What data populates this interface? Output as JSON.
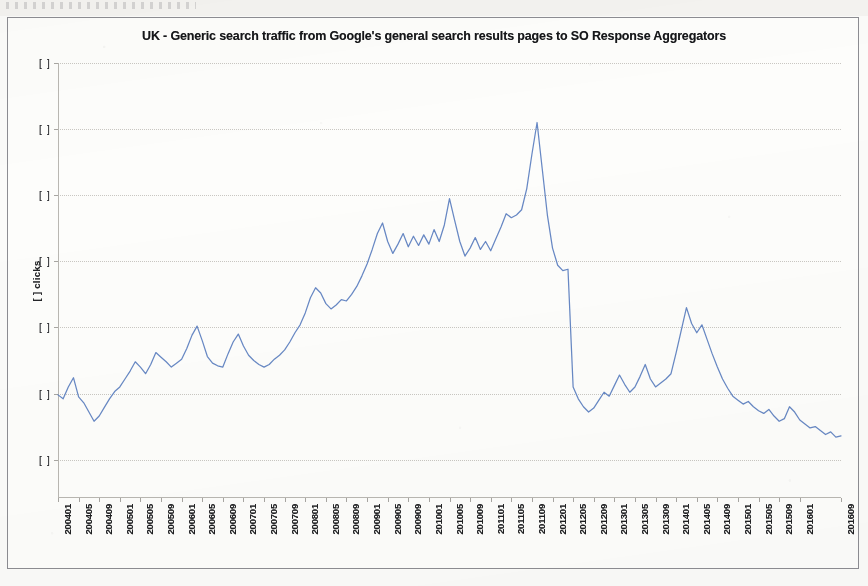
{
  "document": {
    "kind": "scanned-chart-page",
    "page_top_strip": ""
  },
  "chart": {
    "title": "UK - Generic search traffic from Google's general search results pages to SO Response Aggregators",
    "y_axis_title": "[ ] clicks",
    "line_color": "#5b7fc0",
    "gridline_color": "#c9c7c2",
    "frame_color": "#8d8d92",
    "background_color": "#fdfdfb",
    "redaction_marker": "[ ]",
    "y_tick_labels": [
      "[ ]",
      "[ ]",
      "[ ]",
      "[ ]",
      "[ ]",
      "[ ]",
      "[ ]"
    ]
  },
  "chart_data": {
    "type": "line",
    "title": "UK - Generic search traffic from Google's general search results pages to SO Response Aggregators",
    "xlabel": "",
    "ylabel": "[ ] clicks",
    "grid": true,
    "legend": false,
    "y_axis_redacted": true,
    "y_tick_labels": [
      "[ ]",
      "[ ]",
      "[ ]",
      "[ ]",
      "[ ]",
      "[ ]",
      "[ ]"
    ],
    "y_tick_values": [
      7,
      6,
      5,
      4,
      3,
      2,
      1
    ],
    "ylim": [
      0.42,
      7.0
    ],
    "note": "Y-axis values are redacted in the source image; y_tick_values are relative gridline indices (arbitrary units of clicks) used to position the series.",
    "x_tick_labels": [
      "200401",
      "200405",
      "200409",
      "200501",
      "200505",
      "200509",
      "200601",
      "200605",
      "200609",
      "200701",
      "200705",
      "200709",
      "200801",
      "200805",
      "200809",
      "200901",
      "200905",
      "200909",
      "201001",
      "201005",
      "201009",
      "201101",
      "201105",
      "201109",
      "201201",
      "201205",
      "201209",
      "201301",
      "201305",
      "201309",
      "201401",
      "201405",
      "201409",
      "201501",
      "201505",
      "201509",
      "201601",
      "201609"
    ],
    "x_tick_step_months": 4,
    "x": [
      "200401",
      "200402",
      "200403",
      "200404",
      "200405",
      "200406",
      "200407",
      "200408",
      "200409",
      "200410",
      "200411",
      "200412",
      "200501",
      "200502",
      "200503",
      "200504",
      "200505",
      "200506",
      "200507",
      "200508",
      "200509",
      "200510",
      "200511",
      "200512",
      "200601",
      "200602",
      "200603",
      "200604",
      "200605",
      "200606",
      "200607",
      "200608",
      "200609",
      "200610",
      "200611",
      "200612",
      "200701",
      "200702",
      "200703",
      "200704",
      "200705",
      "200706",
      "200707",
      "200708",
      "200709",
      "200710",
      "200711",
      "200712",
      "200801",
      "200802",
      "200803",
      "200804",
      "200805",
      "200806",
      "200807",
      "200808",
      "200809",
      "200810",
      "200811",
      "200812",
      "200901",
      "200902",
      "200903",
      "200904",
      "200905",
      "200906",
      "200907",
      "200908",
      "200909",
      "200910",
      "200911",
      "200912",
      "201001",
      "201002",
      "201003",
      "201004",
      "201005",
      "201006",
      "201007",
      "201008",
      "201009",
      "201010",
      "201011",
      "201012",
      "201101",
      "201102",
      "201103",
      "201104",
      "201105",
      "201106",
      "201107",
      "201108",
      "201109",
      "201110",
      "201111",
      "201112",
      "201201",
      "201202",
      "201203",
      "201204",
      "201205",
      "201206",
      "201207",
      "201208",
      "201209",
      "201210",
      "201211",
      "201212",
      "201301",
      "201302",
      "201303",
      "201304",
      "201305",
      "201306",
      "201307",
      "201308",
      "201309",
      "201310",
      "201311",
      "201312",
      "201401",
      "201402",
      "201403",
      "201404",
      "201405",
      "201406",
      "201407",
      "201408",
      "201409",
      "201410",
      "201411",
      "201412",
      "201501",
      "201502",
      "201503",
      "201504",
      "201505",
      "201506",
      "201507",
      "201508",
      "201509",
      "201510",
      "201511",
      "201512",
      "201601",
      "201602",
      "201603",
      "201604",
      "201605",
      "201606",
      "201607",
      "201608",
      "201609"
    ],
    "values": [
      1.98,
      1.92,
      2.1,
      2.24,
      1.95,
      1.86,
      1.72,
      1.58,
      1.66,
      1.79,
      1.92,
      2.03,
      2.1,
      2.22,
      2.34,
      2.48,
      2.4,
      2.3,
      2.44,
      2.62,
      2.55,
      2.48,
      2.4,
      2.46,
      2.52,
      2.68,
      2.88,
      3.02,
      2.8,
      2.56,
      2.46,
      2.42,
      2.4,
      2.6,
      2.78,
      2.9,
      2.72,
      2.58,
      2.5,
      2.44,
      2.4,
      2.44,
      2.52,
      2.58,
      2.66,
      2.78,
      2.92,
      3.04,
      3.22,
      3.45,
      3.6,
      3.52,
      3.36,
      3.28,
      3.34,
      3.42,
      3.4,
      3.5,
      3.62,
      3.78,
      3.96,
      4.18,
      4.42,
      4.58,
      4.3,
      4.12,
      4.26,
      4.42,
      4.22,
      4.38,
      4.24,
      4.4,
      4.26,
      4.48,
      4.3,
      4.55,
      4.95,
      4.62,
      4.3,
      4.08,
      4.2,
      4.36,
      4.18,
      4.3,
      4.16,
      4.34,
      4.52,
      4.72,
      4.66,
      4.7,
      4.78,
      5.1,
      5.62,
      6.1,
      5.4,
      4.7,
      4.2,
      3.94,
      3.86,
      3.88,
      2.1,
      1.92,
      1.8,
      1.72,
      1.78,
      1.9,
      2.02,
      1.96,
      2.12,
      2.28,
      2.14,
      2.02,
      2.1,
      2.26,
      2.44,
      2.22,
      2.1,
      2.16,
      2.22,
      2.3,
      2.62,
      2.96,
      3.3,
      3.06,
      2.92,
      3.04,
      2.82,
      2.6,
      2.4,
      2.22,
      2.08,
      1.96,
      1.9,
      1.84,
      1.88,
      1.8,
      1.74,
      1.7,
      1.76,
      1.66,
      1.58,
      1.62,
      1.8,
      1.72,
      1.6,
      1.54,
      1.48,
      1.5,
      1.44,
      1.38,
      1.42,
      1.34,
      1.36
    ]
  }
}
